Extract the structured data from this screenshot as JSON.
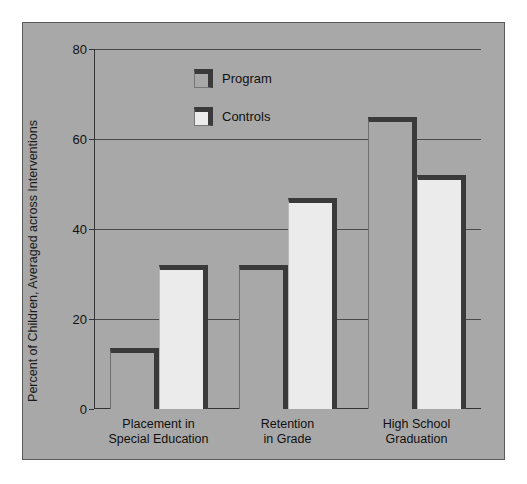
{
  "chart_data": {
    "type": "bar",
    "title": "",
    "subtitle": "",
    "xlabel": "",
    "ylabel": "Percent of Children, Averaged across Interventions",
    "categories": [
      "Placement in\nSpecial Education",
      "Retention\nin Grade",
      "High School\nGraduation"
    ],
    "series": [
      {
        "name": "Program",
        "values": [
          13.5,
          32,
          65
        ]
      },
      {
        "name": "Controls",
        "values": [
          32,
          47,
          52
        ]
      }
    ],
    "ylim": [
      0,
      80
    ],
    "yticks": [
      0,
      20,
      40,
      60,
      80
    ],
    "ytick_labels": [
      "0",
      "20",
      "40",
      "60",
      "80"
    ],
    "grid": true,
    "legend_position": "upper-center",
    "colors": {
      "program_fill": "#a8a8a8",
      "controls_fill": "#ebebeb",
      "bar_outline": "#3a3a3a",
      "plot_background": "#a8a8a8",
      "gridline": "#4a4a4a",
      "axis": "#333333",
      "text": "#111111"
    }
  },
  "legend": {
    "items": [
      {
        "label": "Program",
        "swatch": "program-swatch-icon"
      },
      {
        "label": "Controls",
        "swatch": "controls-swatch-icon"
      }
    ]
  }
}
